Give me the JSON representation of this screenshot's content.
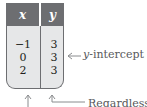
{
  "table": {
    "headers": [
      "x",
      "y"
    ],
    "rows": [
      {
        "x": "−1",
        "y": "3"
      },
      {
        "x": "0",
        "y": "3"
      },
      {
        "x": "2",
        "y": "3"
      }
    ],
    "header_color": "#6d6e71",
    "body_color": "#e6e7e8"
  },
  "annotations": {
    "y_intercept_var": "y",
    "y_intercept_rest": "-intercept",
    "regardless": "Regardless"
  }
}
